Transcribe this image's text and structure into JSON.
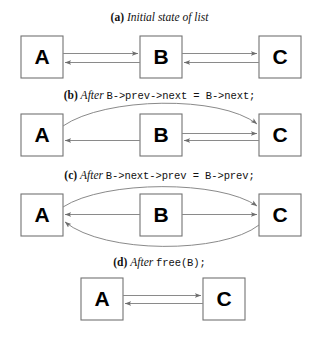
{
  "figure": {
    "title_alt": "Doubly linked list node removal steps",
    "background_color": "#ffffff",
    "box_stroke_color": "#6f6f6f",
    "box_fill_color": "#ffffff",
    "arrow_color": "#7a7a7a",
    "text_color": "#111111"
  },
  "captions": {
    "a": {
      "label": "(a)",
      "italic_word": "Initial state of list",
      "code": ""
    },
    "b": {
      "label": "(b)",
      "italic_word": "After",
      "code": "B->prev->next = B->next;"
    },
    "c": {
      "label": "(c)",
      "italic_word": "After",
      "code": "B->next->prev = B->prev;"
    },
    "d": {
      "label": "(d)",
      "italic_word": "After",
      "code": "free(B);"
    }
  },
  "panels": [
    {
      "id": "a",
      "nodes": [
        {
          "name": "A",
          "x": 21,
          "y": 36,
          "w": 42,
          "h": 42
        },
        {
          "name": "B",
          "x": 140,
          "y": 36,
          "w": 42,
          "h": 42
        },
        {
          "name": "C",
          "x": 259,
          "y": 36,
          "w": 42,
          "h": 42
        }
      ],
      "links": [
        {
          "from": "A",
          "to": "B",
          "kind": "next",
          "shape": "straight"
        },
        {
          "from": "B",
          "to": "A",
          "kind": "prev",
          "shape": "straight"
        },
        {
          "from": "B",
          "to": "C",
          "kind": "next",
          "shape": "straight"
        },
        {
          "from": "C",
          "to": "B",
          "kind": "prev",
          "shape": "straight"
        }
      ]
    },
    {
      "id": "b",
      "nodes": [
        {
          "name": "A",
          "x": 21,
          "y": 114,
          "w": 42,
          "h": 42
        },
        {
          "name": "B",
          "x": 140,
          "y": 114,
          "w": 42,
          "h": 42
        },
        {
          "name": "C",
          "x": 259,
          "y": 114,
          "w": 42,
          "h": 42
        }
      ],
      "links": [
        {
          "from": "A",
          "to": "C",
          "kind": "next",
          "shape": "curve-above"
        },
        {
          "from": "B",
          "to": "A",
          "kind": "prev",
          "shape": "straight"
        },
        {
          "from": "B",
          "to": "C",
          "kind": "next",
          "shape": "straight"
        },
        {
          "from": "C",
          "to": "B",
          "kind": "prev",
          "shape": "straight"
        }
      ]
    },
    {
      "id": "c",
      "nodes": [
        {
          "name": "A",
          "x": 21,
          "y": 194,
          "w": 42,
          "h": 42
        },
        {
          "name": "B",
          "x": 140,
          "y": 194,
          "w": 42,
          "h": 42
        },
        {
          "name": "C",
          "x": 259,
          "y": 194,
          "w": 42,
          "h": 42
        }
      ],
      "links": [
        {
          "from": "A",
          "to": "C",
          "kind": "next",
          "shape": "curve-above"
        },
        {
          "from": "C",
          "to": "A",
          "kind": "prev",
          "shape": "curve-below"
        },
        {
          "from": "B",
          "to": "A",
          "kind": "prev",
          "shape": "straight"
        },
        {
          "from": "B",
          "to": "C",
          "kind": "next",
          "shape": "straight"
        }
      ]
    },
    {
      "id": "d",
      "nodes": [
        {
          "name": "A",
          "x": 81,
          "y": 278,
          "w": 42,
          "h": 42
        },
        {
          "name": "C",
          "x": 203,
          "y": 278,
          "w": 42,
          "h": 42
        }
      ],
      "links": [
        {
          "from": "A",
          "to": "C",
          "kind": "next",
          "shape": "straight"
        },
        {
          "from": "C",
          "to": "A",
          "kind": "prev",
          "shape": "straight"
        }
      ]
    }
  ]
}
